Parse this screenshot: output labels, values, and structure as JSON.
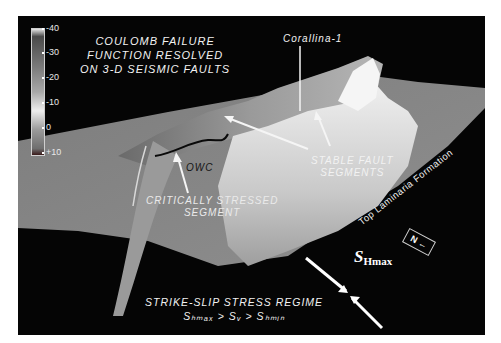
{
  "figure": {
    "title_lines": [
      "COULOMB FAILURE",
      "FUNCTION RESOLVED",
      "ON 3-D SEISMIC FAULTS"
    ],
    "colorbar": {
      "ticks": [
        "-40",
        "-30",
        "-20",
        "-10",
        "0",
        "+10"
      ]
    },
    "well_label": "Corallina-1",
    "stable_lines": [
      "STABLE FAULT",
      "SEGMENTS"
    ],
    "critical_lines": [
      "CRITICALLY STRESSED",
      "SEGMENT"
    ],
    "owc_label": "OWC",
    "horizon_label": "Top Laminaria Formation",
    "regime_lines": [
      "STRIKE-SLIP STRESS REGIME",
      "Sₕₘₐₓ > Sᵥ > Sₕₘᵢₙ"
    ],
    "shmax_symbol": "S",
    "shmax_sub": "Hmax",
    "north_label": "N",
    "colors": {
      "background": "#050505",
      "border": "#ffffff",
      "surface": "#8a8a8a",
      "highlight": "#e6e6e6",
      "text": "#f2f2f2"
    }
  }
}
